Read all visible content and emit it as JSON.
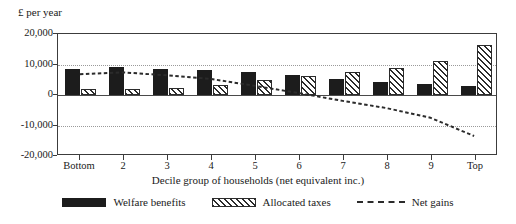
{
  "chart_data": {
    "type": "bar",
    "title": "",
    "ylabel": "£ per year",
    "xlabel": "Decile group of households (net equivalent inc.)",
    "categories": [
      "Bottom",
      "2",
      "3",
      "4",
      "5",
      "6",
      "7",
      "8",
      "9",
      "Top"
    ],
    "ylim": [
      -20000,
      20000
    ],
    "yticks": [
      20000,
      10000,
      0,
      -10000,
      -20000
    ],
    "ytick_labels": [
      "20,000",
      "10,000",
      "0",
      "-10,000",
      "-20,000"
    ],
    "grid": true,
    "legend_position": "bottom",
    "series": [
      {
        "name": "Welfare benefits",
        "type": "bar",
        "values": [
          8600,
          9200,
          8500,
          8100,
          7400,
          6400,
          5300,
          4400,
          3500,
          3000
        ]
      },
      {
        "name": "Allocated taxes",
        "type": "bar",
        "values": [
          2100,
          1900,
          2400,
          3200,
          4800,
          6100,
          7600,
          9000,
          11200,
          16500
        ]
      },
      {
        "name": "Net gains",
        "type": "line",
        "values": [
          6600,
          7200,
          6200,
          5000,
          2700,
          300,
          -2300,
          -4700,
          -7900,
          -14000
        ]
      }
    ]
  },
  "legend": {
    "items": [
      {
        "label": "Welfare benefits",
        "swatch": "solid-black-swatch"
      },
      {
        "label": "Allocated taxes",
        "swatch": "hatched-swatch"
      },
      {
        "label": "Net gains",
        "swatch": "dashed-line-swatch"
      }
    ]
  },
  "colors": {
    "benefits": "#1c1c1c",
    "taxes": "#2b2b2b",
    "netgains": "#2b2b2b",
    "axis": "#3c3c3c",
    "grid": "#9a9a9a",
    "background": "#ffffff"
  }
}
